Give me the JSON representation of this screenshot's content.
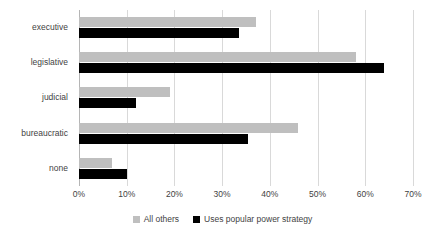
{
  "chart_data": {
    "type": "bar",
    "orientation": "horizontal",
    "title": "",
    "subtitle": "",
    "xlabel": "",
    "ylabel": "",
    "categories": [
      "executive",
      "legislative",
      "judicial",
      "bureaucratic",
      "none"
    ],
    "series": [
      {
        "name": "All others",
        "color": "#bfbfbf",
        "values": [
          37,
          58,
          19,
          46,
          7
        ]
      },
      {
        "name": "Uses popular power strategy",
        "color": "#000000",
        "values": [
          33.5,
          64,
          12,
          35.5,
          10
        ]
      }
    ],
    "xlim": [
      0,
      70
    ],
    "xticks": [
      0,
      10,
      20,
      30,
      40,
      50,
      60,
      70
    ],
    "xtick_labels": [
      "0%",
      "10%",
      "20%",
      "30%",
      "40%",
      "50%",
      "60%",
      "70%"
    ],
    "grid": true,
    "grid_axis": "x",
    "legend_position": "bottom",
    "value_unit": "%"
  },
  "legend": {
    "items": [
      {
        "label": "All others",
        "swatch": "gray-square-icon"
      },
      {
        "label": "Uses popular power strategy",
        "swatch": "black-square-icon"
      }
    ]
  },
  "colors": {
    "series_others": "#bfbfbf",
    "series_popular": "#000000",
    "gridline": "#d9d9d9",
    "axis": "#b5b5b5",
    "text": "#3f3f3f",
    "background": "#ffffff"
  }
}
